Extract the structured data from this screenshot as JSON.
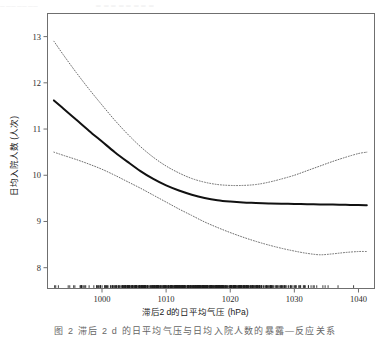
{
  "figure": {
    "ghost_text_left": "▁▁▁▁▁▁▁",
    "ghost_text_right": "▁ ▁ ▁ ▁ ▁ ▁ ▁  ▁",
    "caption": "图 2    滞后 2 d 的日平均气压与日均入院人数的暴露—反应关系"
  },
  "chart_data": {
    "type": "line",
    "title": "",
    "xlabel": "滞后2 d的日平均气压 (hPa)",
    "ylabel": "日均入院人数 (人次)",
    "xlim": [
      991.5,
      1042.5
    ],
    "ylim": [
      7.55,
      13.5
    ],
    "xticks": [
      1000,
      1010,
      1020,
      1030,
      1040
    ],
    "xticklabels": [
      "1000",
      "1010",
      "1020",
      "1030",
      "1040"
    ],
    "yticks": [
      8,
      9,
      10,
      11,
      12,
      13
    ],
    "yticklabels": [
      "8",
      "9",
      "10",
      "11",
      "12",
      "13"
    ],
    "grid": false,
    "legend": null,
    "legend_position": "none",
    "colors": {
      "fit_line": "#111111",
      "confidence_band": "#6b6b6b",
      "axis": "#6f6f6f",
      "rug": "#1c1c1c"
    },
    "series": [
      {
        "name": "估计曲线 (fit)",
        "style": "solid",
        "linewidth": 2.0,
        "x": [
          992.5,
          994,
          996,
          998,
          1000,
          1002,
          1004,
          1006,
          1008,
          1010,
          1012,
          1014,
          1016,
          1018,
          1020,
          1022,
          1024,
          1026,
          1028,
          1030,
          1032,
          1034,
          1036,
          1038,
          1040,
          1041.3
        ],
        "values": [
          11.62,
          11.44,
          11.2,
          10.96,
          10.73,
          10.5,
          10.29,
          10.09,
          9.92,
          9.78,
          9.67,
          9.58,
          9.51,
          9.46,
          9.43,
          9.41,
          9.4,
          9.39,
          9.385,
          9.38,
          9.375,
          9.37,
          9.365,
          9.36,
          9.355,
          9.35
        ]
      },
      {
        "name": "95%置信区间上限 (upper CI)",
        "style": "dotted",
        "linewidth": 1.0,
        "x": [
          992.5,
          994,
          996,
          998,
          1000,
          1002,
          1004,
          1006,
          1008,
          1010,
          1012,
          1014,
          1016,
          1018,
          1020,
          1022,
          1024,
          1026,
          1028,
          1030,
          1032,
          1034,
          1036,
          1038,
          1040,
          1041.3
        ],
        "values": [
          12.9,
          12.6,
          12.22,
          11.86,
          11.52,
          11.19,
          10.89,
          10.62,
          10.39,
          10.2,
          10.05,
          9.93,
          9.85,
          9.8,
          9.78,
          9.78,
          9.8,
          9.85,
          9.92,
          10.0,
          10.1,
          10.2,
          10.3,
          10.39,
          10.47,
          10.5
        ]
      },
      {
        "name": "95%置信区间下限 (lower CI)",
        "style": "dotted",
        "linewidth": 1.0,
        "x": [
          992.5,
          994,
          996,
          998,
          1000,
          1002,
          1004,
          1006,
          1008,
          1010,
          1012,
          1014,
          1016,
          1018,
          1020,
          1022,
          1024,
          1026,
          1028,
          1030,
          1032,
          1034,
          1036,
          1038,
          1040,
          1041.3
        ],
        "values": [
          10.5,
          10.43,
          10.34,
          10.24,
          10.13,
          10.0,
          9.86,
          9.72,
          9.57,
          9.42,
          9.27,
          9.13,
          8.99,
          8.87,
          8.76,
          8.66,
          8.57,
          8.49,
          8.42,
          8.36,
          8.31,
          8.28,
          8.3,
          8.33,
          8.35,
          8.35
        ]
      }
    ],
    "rug": {
      "name": "数据分布 rug",
      "axis": "x",
      "y_top": 7.62,
      "y_bottom": 7.45,
      "note": "dense tick marks along bottom of plot, densest between 1005 and 1030"
    }
  }
}
